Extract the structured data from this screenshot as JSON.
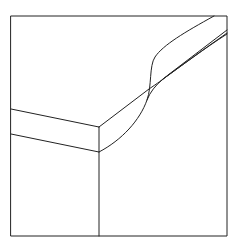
{
  "diagram": {
    "type": "block-diagram-line-drawing",
    "stroke_color": "#222222",
    "background": "#ffffff",
    "frame": {
      "x1": 11,
      "y1": 16,
      "x2": 227,
      "y2": 236
    },
    "front_edge_x": 99,
    "layer_lines_left": [
      {
        "from": [
          11,
          109
        ],
        "to": [
          99,
          127
        ]
      },
      {
        "from": [
          11,
          134
        ],
        "to": [
          99,
          152
        ]
      }
    ],
    "labels": []
  }
}
